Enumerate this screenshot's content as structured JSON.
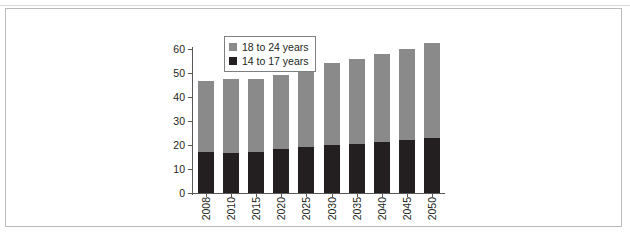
{
  "chart_data": {
    "type": "bar",
    "stacked": true,
    "title": "",
    "subtitle": "",
    "xlabel": "",
    "ylabel": "",
    "categories": [
      "2008",
      "2010",
      "2015",
      "2020",
      "2025",
      "2030",
      "2035",
      "2040",
      "2045",
      "2050"
    ],
    "series": [
      {
        "name": "14 to 17 years",
        "color": "#231f20",
        "values": [
          17,
          16.8,
          17,
          18.2,
          19,
          20,
          20.6,
          21.3,
          22,
          22.8
        ]
      },
      {
        "name": "18 to 24 years",
        "color": "#8a8a8a",
        "values": [
          29.5,
          30.8,
          30.7,
          30.8,
          32.2,
          34,
          35.3,
          36.7,
          38,
          39.6
        ]
      }
    ],
    "totals": [
      46.5,
      47.6,
      47.7,
      49,
      51.2,
      54,
      55.9,
      58,
      60,
      62.4
    ],
    "ylim": [
      0,
      60
    ],
    "y_ticks": [
      "0",
      "10",
      "20",
      "30",
      "40",
      "50",
      "60"
    ],
    "grid": false,
    "legend_position": "top-left-inside"
  },
  "legend": {
    "items": [
      {
        "label": "18 to 24 years",
        "color": "#8a8a8a"
      },
      {
        "label": "14 to 17 years",
        "color": "#231f20"
      }
    ]
  },
  "colors": {
    "older_group": "#8a8a8a",
    "younger_group": "#231f20",
    "axis": "#585858",
    "frame": "#b9bbbd",
    "text": "#231f20",
    "background": "#ffffff"
  }
}
